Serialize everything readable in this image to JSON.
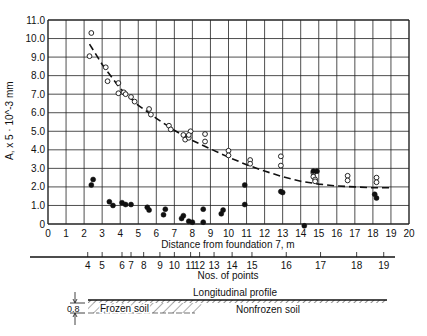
{
  "chart_data": {
    "type": "scatter",
    "title": "",
    "xlabel": "Distance from foundation 7, m",
    "ylabel": "A, x 5 · 10^-3 mm",
    "xlim": [
      0,
      20
    ],
    "ylim": [
      0,
      11
    ],
    "grid": true,
    "x_ticks": [
      0,
      1,
      2,
      3,
      4,
      5,
      6,
      7,
      8,
      9,
      10,
      11,
      12,
      13,
      14,
      15,
      16,
      17,
      18,
      19,
      20
    ],
    "y_ticks": [
      "0",
      "1.0",
      "2.0",
      "3.0",
      "4.0",
      "5.0",
      "6.0",
      "7.0",
      "8.0",
      "9.0",
      "10.0",
      "11.0"
    ],
    "series": [
      {
        "name": "Open circles (upper)",
        "marker": "open-circle",
        "points": [
          [
            2.4,
            10.3
          ],
          [
            2.3,
            9.05
          ],
          [
            3.2,
            8.45
          ],
          [
            3.3,
            7.7
          ],
          [
            3.9,
            7.6
          ],
          [
            3.9,
            7.05
          ],
          [
            4.2,
            7.1
          ],
          [
            4.3,
            7.0
          ],
          [
            4.6,
            6.85
          ],
          [
            4.8,
            6.6
          ],
          [
            5.6,
            6.2
          ],
          [
            5.7,
            5.9
          ],
          [
            6.7,
            5.3
          ],
          [
            6.8,
            5.1
          ],
          [
            7.5,
            4.8
          ],
          [
            7.6,
            4.55
          ],
          [
            7.8,
            4.65
          ],
          [
            7.9,
            5.0
          ],
          [
            7.8,
            4.8
          ],
          [
            8.7,
            4.85
          ],
          [
            8.7,
            4.45
          ],
          [
            10.0,
            3.95
          ],
          [
            10.0,
            3.7
          ],
          [
            11.2,
            3.45
          ],
          [
            11.2,
            3.25
          ],
          [
            12.9,
            3.65
          ],
          [
            12.9,
            3.15
          ],
          [
            14.7,
            2.75
          ],
          [
            14.7,
            2.55
          ],
          [
            14.8,
            2.4
          ],
          [
            14.8,
            2.3
          ],
          [
            16.6,
            2.6
          ],
          [
            16.6,
            2.35
          ],
          [
            18.2,
            2.5
          ],
          [
            18.2,
            2.25
          ]
        ]
      },
      {
        "name": "Filled circles (lower)",
        "marker": "filled-circle",
        "points": [
          [
            2.4,
            2.1
          ],
          [
            2.5,
            2.4
          ],
          [
            3.4,
            1.2
          ],
          [
            3.6,
            1.0
          ],
          [
            4.1,
            1.15
          ],
          [
            4.3,
            1.05
          ],
          [
            4.6,
            1.05
          ],
          [
            5.5,
            0.9
          ],
          [
            5.6,
            0.75
          ],
          [
            6.4,
            0.5
          ],
          [
            6.5,
            0.8
          ],
          [
            7.4,
            0.3
          ],
          [
            7.5,
            0.45
          ],
          [
            7.8,
            0.15
          ],
          [
            8.0,
            0.1
          ],
          [
            8.6,
            0.8
          ],
          [
            8.6,
            0.1
          ],
          [
            9.6,
            0.55
          ],
          [
            9.7,
            0.75
          ],
          [
            10.9,
            2.1
          ],
          [
            10.9,
            1.05
          ],
          [
            12.9,
            1.75
          ],
          [
            13.0,
            1.7
          ],
          [
            14.2,
            -0.1
          ],
          [
            14.7,
            2.85
          ],
          [
            14.9,
            2.85
          ],
          [
            18.1,
            1.6
          ],
          [
            18.2,
            1.4
          ]
        ]
      },
      {
        "name": "Fitted curve",
        "marker": "dashed-line",
        "points": [
          [
            2.3,
            9.7
          ],
          [
            3,
            8.6
          ],
          [
            4,
            7.3
          ],
          [
            5,
            6.4
          ],
          [
            6,
            5.7
          ],
          [
            7,
            5.05
          ],
          [
            8,
            4.5
          ],
          [
            9,
            4.05
          ],
          [
            10,
            3.6
          ],
          [
            11,
            3.2
          ],
          [
            12,
            2.85
          ],
          [
            13,
            2.55
          ],
          [
            14,
            2.3
          ],
          [
            15,
            2.15
          ],
          [
            16,
            2.05
          ],
          [
            17,
            2.0
          ],
          [
            18,
            1.95
          ],
          [
            19,
            1.95
          ]
        ]
      }
    ],
    "secondary_axis": {
      "label": "Nos. of points",
      "ticks": [
        {
          "label": "4",
          "x": 2.2
        },
        {
          "label": "5",
          "x": 3.0
        },
        {
          "label": "6",
          "x": 4.1
        },
        {
          "label": "7",
          "x": 4.6
        },
        {
          "label": "8",
          "x": 5.3
        },
        {
          "label": "9",
          "x": 6.2
        },
        {
          "label": "10",
          "x": 7.0
        },
        {
          "label": "11",
          "x": 7.9
        },
        {
          "label": "12",
          "x": 8.4
        },
        {
          "label": "13",
          "x": 9.2
        },
        {
          "label": "14",
          "x": 10.2
        },
        {
          "label": "15",
          "x": 11.3
        },
        {
          "label": "16",
          "x": 13.2
        },
        {
          "label": "17",
          "x": 15.1
        },
        {
          "label": "18",
          "x": 17.1
        },
        {
          "label": "19",
          "x": 18.6
        }
      ]
    },
    "profile": {
      "title": "Longitudinal profile",
      "depth_label": "0.8",
      "frozen_label": "Frozen soil",
      "nonfrozen_label": "Nonfrozen soil"
    }
  }
}
